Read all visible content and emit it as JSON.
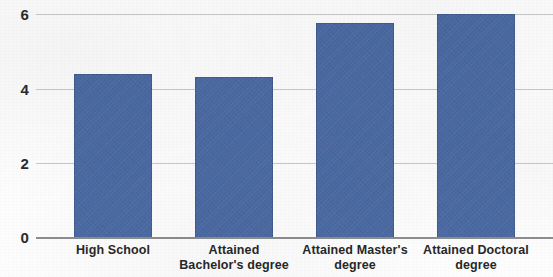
{
  "chart_data": {
    "type": "bar",
    "title": "",
    "subtitle": "",
    "xlabel": "",
    "ylabel": "",
    "categories": [
      "High School",
      "Attained Bachelor's degree",
      "Attained Master's degree",
      "Attained Doctoral degree"
    ],
    "category_lines": [
      [
        "High School"
      ],
      [
        "Attained",
        "Bachelor's degree"
      ],
      [
        "Attained Master's",
        "degree"
      ],
      [
        "Attained Doctoral",
        "degree"
      ]
    ],
    "values": [
      4.4,
      4.3,
      5.75,
      6.0
    ],
    "ylim": [
      0,
      6
    ],
    "yticks": [
      0,
      2,
      4,
      6
    ],
    "ytick_labels": [
      "0",
      "2",
      "4",
      "6"
    ],
    "grid": true,
    "grid_axis": "y",
    "legend": false,
    "legend_position": "none",
    "bar_color": "#4a6aa3",
    "gridline_color": "#c9c9c9",
    "axis_color": "#8e8e8e",
    "background_color": "#fdfdfd",
    "label_color": "#282828"
  }
}
